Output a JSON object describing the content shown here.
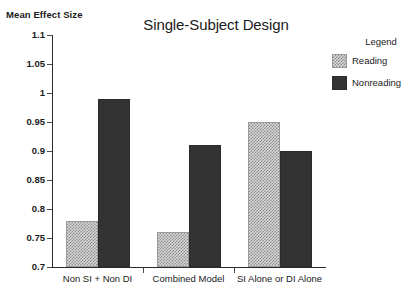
{
  "chart_data": {
    "type": "bar",
    "title": "Single-Subject Design",
    "xlabel": "",
    "ylabel": "Mean Effect Size",
    "ylim": [
      0.7,
      1.1
    ],
    "yticks": [
      "1.1",
      "1.05",
      "1",
      "0.95",
      "0.9",
      "0.85",
      "0.8",
      "0.75",
      "0.7"
    ],
    "ytick_values": [
      1.1,
      1.05,
      1.0,
      0.95,
      0.9,
      0.85,
      0.8,
      0.75,
      0.7
    ],
    "grid": false,
    "legend_position": "right",
    "legend_title": "Legend",
    "categories": [
      "Non SI + Non DI",
      "Combined Model",
      "SI Alone or DI Alone"
    ],
    "series": [
      {
        "name": "Reading",
        "values": [
          0.78,
          0.76,
          0.95
        ],
        "color": "#d9d9d9",
        "pattern": "checkered"
      },
      {
        "name": "Nonreading",
        "values": [
          0.99,
          0.91,
          0.9
        ],
        "color": "#333333",
        "pattern": "solid"
      }
    ]
  },
  "axis": {
    "y_title": "Mean Effect Size"
  },
  "legend": {
    "title": "Legend",
    "entries": [
      {
        "label": "Reading"
      },
      {
        "label": "Nonreading"
      }
    ]
  }
}
